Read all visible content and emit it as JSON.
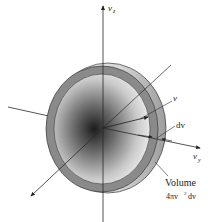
{
  "diagram": {
    "axes": {
      "vz": {
        "label": "v",
        "subscript": "z"
      },
      "vy": {
        "label": "v",
        "subscript": "y"
      },
      "vx": {
        "label": ""
      }
    },
    "labels": {
      "radius": "v",
      "thickness": "dv",
      "volume_title": "Volume",
      "volume_expr_prefix": "4πv",
      "volume_expr_power": "2",
      "volume_expr_suffix": "dv"
    },
    "colors": {
      "shell": "#8a8a8a",
      "shell_edge": "#3a3a3a",
      "center_dark": "#1e1e1e",
      "center_light": "#e6e6e6",
      "axis": "#2a2a2a",
      "background": "#ffffff"
    }
  }
}
